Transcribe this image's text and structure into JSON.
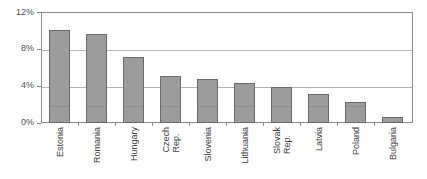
{
  "chart_data": {
    "type": "bar",
    "title": "",
    "subtitle": "",
    "xlabel": "",
    "ylabel": "",
    "categories": [
      "Estonia",
      "Romania",
      "Hungary",
      "Czech Rep.",
      "Slovenia",
      "Lithuania",
      "Slovak Rep.",
      "Latvia",
      "Poland",
      "Bulgaria"
    ],
    "category_lines": [
      [
        "Estonia"
      ],
      [
        "Romania"
      ],
      [
        "Hungary"
      ],
      [
        "Czech",
        "Rep."
      ],
      [
        "Slovenia"
      ],
      [
        "Lithuania"
      ],
      [
        "Slovak",
        "Rep."
      ],
      [
        "Latvia"
      ],
      [
        "Poland"
      ],
      [
        "Bulgaria"
      ]
    ],
    "values": [
      10.0,
      9.6,
      7.1,
      5.1,
      4.8,
      4.3,
      3.9,
      3.1,
      2.3,
      0.7
    ],
    "value_labels": [
      "10.0%",
      "9.6%",
      "7.1%",
      "5.1%",
      "4.8%",
      "4.3%",
      "3.9%",
      "3.1%",
      "2.3%",
      "0.7%"
    ],
    "ylim": [
      0,
      12
    ],
    "yticks": [
      0,
      4,
      8,
      12
    ],
    "ytick_labels": [
      "0%",
      "4%",
      "8%",
      "12%"
    ],
    "grid": true,
    "grid_axis": "y",
    "legend": false,
    "legend_position": "none",
    "series": [
      {
        "name": "",
        "values": [
          10.0,
          9.6,
          7.1,
          5.1,
          4.8,
          4.3,
          3.9,
          3.1,
          2.3,
          0.7
        ]
      }
    ],
    "colors": {
      "bar_fill": "#9c9c9c",
      "bar_border": "#6b6b6b",
      "gridline": "#b3b3b3",
      "frame": "#8a8a8a",
      "text": "#3d3d3d",
      "background": "#ffffff"
    }
  }
}
